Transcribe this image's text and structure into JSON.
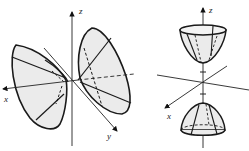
{
  "figures": [
    {
      "id": "left",
      "description": "Hyperboloid of two sheets opening along the x-axis",
      "axes": {
        "x": "x",
        "y": "y",
        "z": "z"
      },
      "surface_fill": "#e8e8e8",
      "stroke": "#1a1a1a"
    },
    {
      "id": "right",
      "description": "Hyperboloid of two sheets opening along the z-axis",
      "axes": {
        "x": "x",
        "z": "z"
      },
      "surface_fill": "#e8e8e8",
      "stroke": "#1a1a1a"
    }
  ],
  "labels": {
    "left_x": "x",
    "left_y": "y",
    "left_z": "z",
    "right_x": "x",
    "right_z": "z"
  }
}
